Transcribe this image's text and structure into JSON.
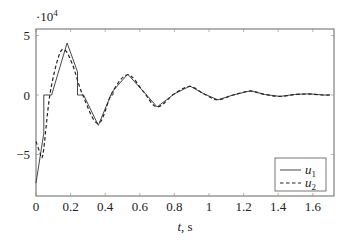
{
  "chart_data": {
    "type": "line",
    "title": "",
    "xlabel": "t, s",
    "ylabel": "",
    "y_scale_label": "·10^4",
    "xlim": [
      0,
      1.7
    ],
    "ylim": [
      -8.5,
      5.5
    ],
    "x_ticks": [
      0,
      0.2,
      0.4,
      0.6,
      0.8,
      1,
      1.2,
      1.4,
      1.6
    ],
    "x_tick_labels": [
      "0",
      "0.2",
      "0.4",
      "0.6",
      "0.8",
      "1",
      "1.2",
      "1.4",
      "1.6"
    ],
    "y_ticks": [
      -5,
      0,
      5
    ],
    "y_tick_labels": [
      "−5",
      "0",
      "5"
    ],
    "grid": false,
    "legend_position": "lower right",
    "series": [
      {
        "name": "u1",
        "style": "solid",
        "color": "#333333",
        "x": [
          0.0,
          0.045,
          0.045,
          0.09,
          0.18,
          0.24,
          0.24,
          0.275,
          0.36,
          0.43,
          0.43,
          0.445,
          0.445,
          0.53,
          0.62,
          0.7,
          0.8,
          0.89,
          0.97,
          1.05,
          1.14,
          1.24,
          1.32,
          1.41,
          1.5,
          1.58,
          1.66,
          1.7
        ],
        "values": [
          -7.4,
          -3.2,
          0.0,
          0.0,
          4.37,
          1.95,
          0.0,
          0.0,
          -2.55,
          -0.1,
          0.0,
          0.0,
          0.35,
          1.75,
          0.3,
          -1.0,
          0.1,
          0.75,
          0.1,
          -0.4,
          0.0,
          0.35,
          0.05,
          -0.12,
          0.05,
          0.1,
          0.0,
          0.0
        ]
      },
      {
        "name": "u2",
        "style": "dashed",
        "color": "#222222",
        "x": [
          0.0,
          0.02,
          0.04,
          0.08,
          0.13,
          0.165,
          0.21,
          0.27,
          0.36,
          0.44,
          0.53,
          0.62,
          0.7,
          0.8,
          0.89,
          0.97,
          1.05,
          1.14,
          1.24,
          1.32,
          1.41,
          1.5,
          1.58,
          1.66,
          1.7
        ],
        "values": [
          -3.9,
          -4.7,
          -5.0,
          0.0,
          3.2,
          3.8,
          2.6,
          0.0,
          -2.4,
          0.2,
          1.7,
          0.3,
          -1.0,
          0.1,
          0.72,
          0.1,
          -0.4,
          0.0,
          0.33,
          0.05,
          -0.12,
          0.05,
          0.08,
          0.0,
          0.0
        ]
      }
    ]
  },
  "legend": {
    "items": [
      {
        "label_base": "u",
        "label_sub": "1",
        "style": "solid"
      },
      {
        "label_base": "u",
        "label_sub": "2",
        "style": "dashed"
      }
    ]
  },
  "axes": {
    "x_label": "t, s",
    "y_multiplier_base": "·10",
    "y_multiplier_exp": "4"
  }
}
